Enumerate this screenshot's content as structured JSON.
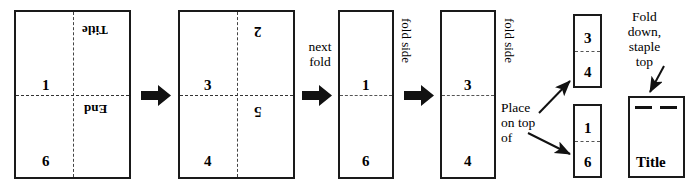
{
  "diagram": {
    "ink_color": "#1a1a1a",
    "paper_color": "#ffffff"
  },
  "sheets": [
    {
      "id": "sheet-unfolded-side-a",
      "marks": {
        "top_right": "Title",
        "mid_left": "1",
        "mid_right": "End",
        "bottom_left": "6"
      }
    },
    {
      "id": "sheet-unfolded-side-b",
      "marks": {
        "top_right": "2",
        "mid_left": "3",
        "mid_right": "5",
        "bottom_left": "4"
      }
    },
    {
      "id": "sheet-folded-once-a",
      "marks": {
        "upper": "1",
        "lower": "6"
      }
    },
    {
      "id": "sheet-folded-once-b",
      "marks": {
        "upper": "3",
        "lower": "4"
      }
    }
  ],
  "small_sheets": [
    {
      "id": "sheet-quarter-top",
      "upper": "3",
      "lower": "4"
    },
    {
      "id": "sheet-quarter-bottom",
      "upper": "1",
      "lower": "6"
    }
  ],
  "final_booklet": {
    "title_label": "Title"
  },
  "captions": {
    "next_fold": "next\nfold",
    "fold_side_1": "fold  side",
    "fold_side_2": "fold  side",
    "place_on_top_of": "Place\non  top\nof",
    "fold_down_staple_top": "Fold\ndown,\nstaple\ntop"
  },
  "arrows": [
    {
      "name": "step-arrow-1",
      "kind": "block-right"
    },
    {
      "name": "step-arrow-2",
      "kind": "block-right"
    },
    {
      "name": "step-arrow-3",
      "kind": "block-right"
    },
    {
      "name": "pointer-arrow-up-right",
      "kind": "thin-diagonal"
    },
    {
      "name": "pointer-arrow-down-right",
      "kind": "thin-diagonal"
    },
    {
      "name": "pointer-arrow-staple",
      "kind": "thin-diagonal"
    }
  ]
}
